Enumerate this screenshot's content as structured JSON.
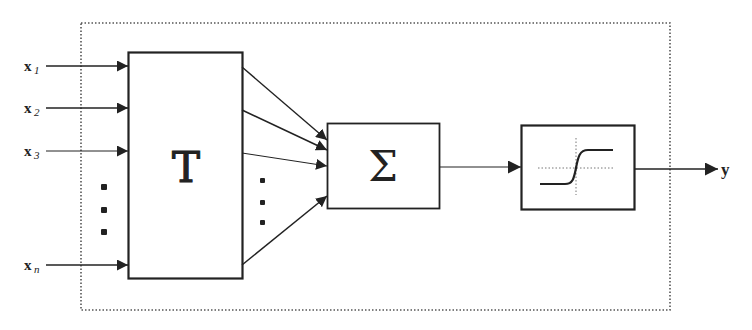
{
  "diagram": {
    "type": "neuron-block-diagram",
    "inputs": [
      {
        "base": "x",
        "sub": "1"
      },
      {
        "base": "x",
        "sub": "2"
      },
      {
        "base": "x",
        "sub": "3"
      },
      {
        "base": "x",
        "sub": "n"
      }
    ],
    "ellipsis": "⋮",
    "blocks": {
      "transform": {
        "label": "T"
      },
      "sum": {
        "label": "Σ"
      },
      "activation": {
        "label": "sigmoid"
      }
    },
    "output": {
      "label": "y"
    },
    "colors": {
      "stroke": "#222222",
      "dotted": "#555555",
      "background": "#ffffff"
    }
  }
}
